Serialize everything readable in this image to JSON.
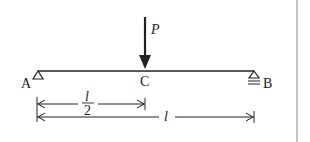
{
  "diagram": {
    "type": "simply-supported-beam",
    "load": {
      "label": "P",
      "position": "C"
    },
    "points": {
      "left": "A",
      "mid": "C",
      "right": "B"
    },
    "dimensions": {
      "half": {
        "numerator": "l",
        "denominator": "2"
      },
      "full": "l"
    },
    "colors": {
      "ink": "#222222",
      "divider": "#888888",
      "background": "#ffffff"
    }
  }
}
